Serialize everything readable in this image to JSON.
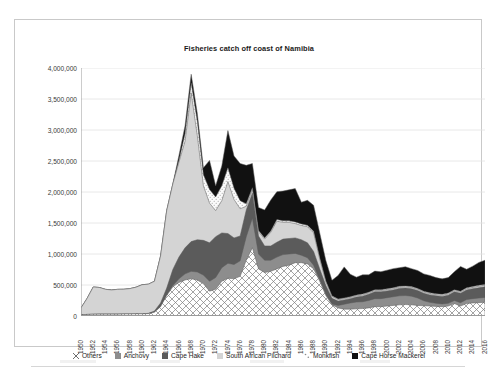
{
  "chart_data": {
    "type": "area",
    "stacked": true,
    "title": "Fisheries catch off coast of Namibia",
    "xlabel": "",
    "ylabel": "",
    "ylim": [
      0,
      4000000
    ],
    "ytick_labels": [
      "4,000,000",
      "3,500,000",
      "3,000,000",
      "2,500,000",
      "2,000,000",
      "1,500,000",
      "1,000,000",
      "500,000",
      "0"
    ],
    "ytick_values": [
      4000000,
      3500000,
      3000000,
      2500000,
      2000000,
      1500000,
      1000000,
      500000,
      0
    ],
    "grid": "horizontal",
    "legend_position": "bottom",
    "x": [
      1950,
      1951,
      1952,
      1953,
      1954,
      1955,
      1956,
      1957,
      1958,
      1959,
      1960,
      1961,
      1962,
      1963,
      1964,
      1965,
      1966,
      1967,
      1968,
      1969,
      1970,
      1971,
      1972,
      1973,
      1974,
      1975,
      1976,
      1977,
      1978,
      1979,
      1980,
      1981,
      1982,
      1983,
      1984,
      1985,
      1986,
      1987,
      1988,
      1989,
      1990,
      1991,
      1992,
      1993,
      1994,
      1995,
      1996,
      1997,
      1998,
      1999,
      2000,
      2001,
      2002,
      2003,
      2004,
      2005,
      2006,
      2007,
      2008,
      2009,
      2010,
      2011,
      2012,
      2013,
      2014,
      2015,
      2016
    ],
    "xtick_labels": [
      "1950",
      "1952",
      "1954",
      "1956",
      "1958",
      "1960",
      "1962",
      "1964",
      "1966",
      "1968",
      "1970",
      "1972",
      "1974",
      "1976",
      "1978",
      "1980",
      "1982",
      "1984",
      "1986",
      "1988",
      "1990",
      "1992",
      "1994",
      "1996",
      "1998",
      "2000",
      "2002",
      "2004",
      "2006",
      "2008",
      "2010",
      "2012",
      "2014",
      "2016"
    ],
    "series": [
      {
        "name": "Others",
        "fill": "cross-hatch",
        "color": "#ffffff",
        "values": [
          20000,
          25000,
          28000,
          30000,
          30000,
          30000,
          30000,
          32000,
          32000,
          35000,
          35000,
          38000,
          60000,
          150000,
          330000,
          470000,
          540000,
          580000,
          600000,
          580000,
          520000,
          400000,
          430000,
          560000,
          610000,
          600000,
          640000,
          900000,
          1100000,
          760000,
          700000,
          720000,
          760000,
          800000,
          820000,
          860000,
          860000,
          840000,
          760000,
          560000,
          330000,
          180000,
          130000,
          110000,
          110000,
          115000,
          120000,
          130000,
          150000,
          150000,
          160000,
          170000,
          180000,
          185000,
          180000,
          170000,
          165000,
          160000,
          155000,
          150000,
          160000,
          200000,
          160000,
          200000,
          210000,
          215000,
          220000
        ]
      },
      {
        "name": "Anchovy",
        "fill": "solid",
        "color": "#8d8d8d",
        "values": [
          0,
          0,
          0,
          0,
          0,
          0,
          0,
          0,
          0,
          0,
          0,
          0,
          0,
          0,
          0,
          20000,
          60000,
          100000,
          120000,
          130000,
          140000,
          160000,
          190000,
          220000,
          240000,
          230000,
          250000,
          380000,
          480000,
          240000,
          200000,
          180000,
          190000,
          190000,
          180000,
          150000,
          120000,
          100000,
          60000,
          30000,
          20000,
          15000,
          40000,
          80000,
          100000,
          110000,
          110000,
          120000,
          130000,
          130000,
          135000,
          140000,
          145000,
          145000,
          140000,
          120000,
          80000,
          60000,
          50000,
          45000,
          45000,
          50000,
          55000,
          65000,
          70000,
          75000,
          80000
        ]
      },
      {
        "name": "Cape Hake",
        "fill": "solid",
        "color": "#5b5b5b",
        "values": [
          0,
          0,
          0,
          0,
          0,
          0,
          0,
          0,
          0,
          0,
          0,
          5000,
          20000,
          60000,
          120000,
          260000,
          350000,
          420000,
          480000,
          520000,
          560000,
          620000,
          660000,
          560000,
          480000,
          430000,
          400000,
          430000,
          400000,
          290000,
          230000,
          230000,
          240000,
          250000,
          250000,
          250000,
          250000,
          240000,
          220000,
          170000,
          140000,
          90000,
          70000,
          70000,
          70000,
          80000,
          90000,
          100000,
          110000,
          110000,
          110000,
          110000,
          120000,
          120000,
          120000,
          120000,
          120000,
          120000,
          120000,
          120000,
          130000,
          140000,
          150000,
          155000,
          160000,
          165000,
          170000
        ]
      },
      {
        "name": "South African Pilchard",
        "fill": "solid",
        "color": "#d4d4d4",
        "values": [
          110000,
          260000,
          440000,
          430000,
          400000,
          390000,
          400000,
          400000,
          410000,
          430000,
          470000,
          470000,
          480000,
          760000,
          1250000,
          1380000,
          1530000,
          1720000,
          2400000,
          1680000,
          880000,
          640000,
          420000,
          520000,
          840000,
          620000,
          440000,
          60000,
          60000,
          70000,
          110000,
          220000,
          340000,
          270000,
          260000,
          230000,
          230000,
          260000,
          300000,
          160000,
          60000,
          30000,
          25000,
          20000,
          20000,
          20000,
          20000,
          20000,
          20000,
          20000,
          20000,
          20000,
          20000,
          20000,
          20000,
          20000,
          20000,
          20000,
          20000,
          20000,
          20000,
          20000,
          20000,
          20000,
          20000,
          25000,
          25000
        ]
      },
      {
        "name": "Monkfish",
        "fill": "dot-hatch",
        "color": "#fafafa",
        "values": [
          0,
          0,
          0,
          0,
          0,
          0,
          0,
          0,
          0,
          0,
          0,
          0,
          0,
          0,
          0,
          0,
          30000,
          120000,
          160000,
          230000,
          180000,
          220000,
          220000,
          240000,
          220000,
          180000,
          130000,
          40000,
          30000,
          20000,
          20000,
          20000,
          25000,
          25000,
          25000,
          25000,
          25000,
          25000,
          25000,
          20000,
          15000,
          10000,
          10000,
          12000,
          12000,
          12000,
          14000,
          14000,
          14000,
          14000,
          14000,
          14000,
          14000,
          14000,
          14000,
          14000,
          14000,
          14000,
          14000,
          14000,
          14000,
          14000,
          14000,
          14000,
          14000,
          14000,
          14000
        ]
      },
      {
        "name": "Cape Horse Mackerel",
        "fill": "solid",
        "color": "#111111",
        "values": [
          0,
          0,
          0,
          0,
          0,
          0,
          0,
          0,
          0,
          0,
          0,
          0,
          0,
          0,
          0,
          0,
          80000,
          130000,
          140000,
          130000,
          110000,
          470000,
          180000,
          320000,
          600000,
          520000,
          600000,
          620000,
          390000,
          370000,
          450000,
          500000,
          450000,
          480000,
          500000,
          540000,
          350000,
          400000,
          420000,
          400000,
          330000,
          250000,
          380000,
          500000,
          360000,
          290000,
          310000,
          280000,
          300000,
          290000,
          300000,
          310000,
          300000,
          310000,
          290000,
          290000,
          280000,
          280000,
          260000,
          250000,
          250000,
          290000,
          400000,
          300000,
          330000,
          370000,
          390000
        ]
      }
    ]
  },
  "legend": {
    "items": [
      {
        "label": "Others",
        "marker": "cross-hatch-swatch"
      },
      {
        "label": "Anchovy",
        "marker": "gray-swatch"
      },
      {
        "label": "Cape Hake",
        "marker": "dark-gray-swatch"
      },
      {
        "label": "South African Pilchard",
        "marker": "light-gray-swatch"
      },
      {
        "label": "Monkfish",
        "marker": "dot-hatch-swatch"
      },
      {
        "label": "Cape Horse Mackerel",
        "marker": "black-swatch"
      }
    ]
  },
  "colors": {
    "others": "#ffffff",
    "anchovy": "#8d8d8d",
    "cape_hake": "#5b5b5b",
    "south_african_pilchard": "#d4d4d4",
    "monkfish": "#fafafa",
    "cape_horse_mackerel": "#111111",
    "grid": "#e2e2e2",
    "axis": "#9a9a9a",
    "text": "#3a3a3a",
    "card_border": "#c9c9c9"
  }
}
